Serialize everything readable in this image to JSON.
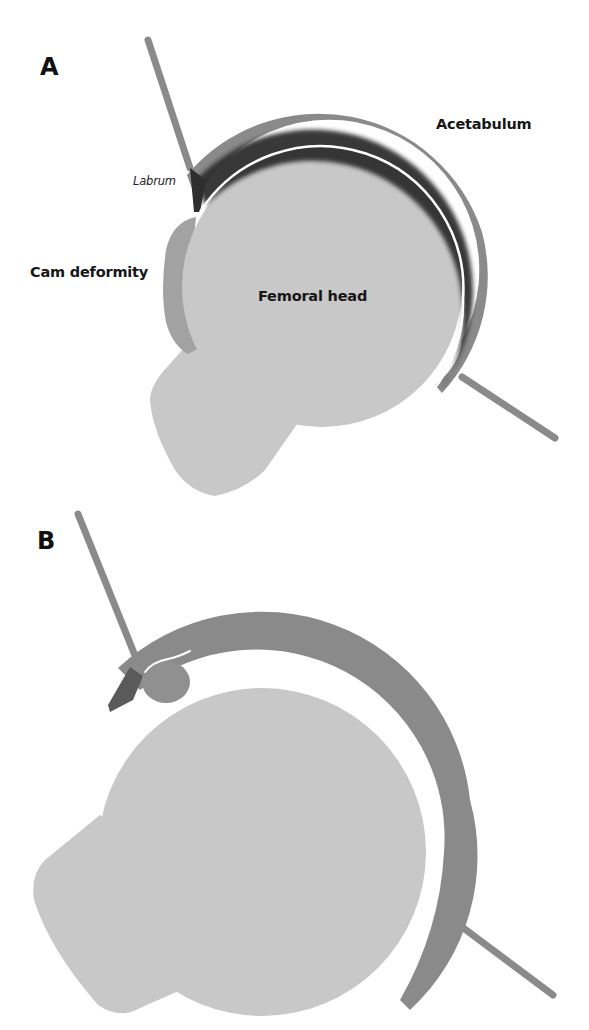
{
  "figure": {
    "panels": [
      {
        "id": "A",
        "letter": "A",
        "description": "Hip joint with cam deformity",
        "labels": {
          "acetabulum": "Acetabulum",
          "labrum": "Labrum",
          "cam": "Cam deformity",
          "femoral_head": "Femoral head"
        }
      },
      {
        "id": "B",
        "letter": "B",
        "description": "Hip joint with labral tear and cartilage damage"
      }
    ],
    "colors": {
      "background": "#ffffff",
      "bone": "#c8c8c8",
      "acetabulum": "#8a8a8a",
      "cartilage_dark": "#2e2e2e",
      "cam": "#a2a2a2",
      "lesion": "#8f8f8f",
      "text": "#161616"
    }
  }
}
